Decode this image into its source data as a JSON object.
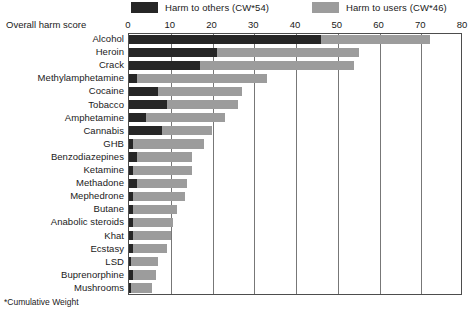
{
  "legend": {
    "items": [
      {
        "label": "Harm to others (CW*54)",
        "color": "#262626",
        "key": "harm_to_others"
      },
      {
        "label": "Harm to users (CW*46)",
        "color": "#9c9c9c",
        "key": "harm_to_users"
      }
    ]
  },
  "axis_title": "Overall harm score",
  "footnote": "*Cumulative Weight",
  "chart_data": {
    "type": "bar",
    "orientation": "horizontal",
    "stacked": true,
    "title": "",
    "subtitle": "",
    "xlabel": "Overall harm score",
    "ylabel": "",
    "xlim": [
      0,
      80
    ],
    "xticks": [
      0,
      10,
      20,
      30,
      40,
      50,
      60,
      70,
      80
    ],
    "xtick_labels": [
      "0",
      "10",
      "20",
      "30",
      "40",
      "50",
      "60",
      "70",
      "80"
    ],
    "grid": true,
    "legend_position": "top",
    "categories": [
      "Alcohol",
      "Heroin",
      "Crack",
      "Methylamphetamine",
      "Cocaine",
      "Tobacco",
      "Amphetamine",
      "Cannabis",
      "GHB",
      "Benzodiazepines",
      "Ketamine",
      "Methadone",
      "Mephedrone",
      "Butane",
      "Anabolic steroids",
      "Khat",
      "Ecstasy",
      "LSD",
      "Buprenorphine",
      "Mushrooms"
    ],
    "series": [
      {
        "name": "Harm to others (CW*54)",
        "color": "#262626",
        "values": [
          46,
          21,
          17,
          2,
          7,
          9,
          4,
          8,
          1,
          2,
          1,
          2,
          1,
          1,
          1,
          1,
          1,
          0.5,
          1,
          0.5
        ]
      },
      {
        "name": "Harm to users (CW*46)",
        "color": "#9c9c9c",
        "values": [
          26,
          34,
          37,
          31,
          20,
          17,
          19,
          12,
          17,
          13,
          14,
          12,
          12.5,
          10.5,
          9.5,
          9,
          8,
          6.5,
          5.5,
          5
        ]
      }
    ],
    "totals": [
      72,
      55,
      54,
      33,
      27,
      26,
      23,
      20,
      18,
      15,
      15,
      14,
      13.5,
      11.5,
      10.5,
      10,
      9,
      7,
      6.5,
      5.5
    ]
  }
}
